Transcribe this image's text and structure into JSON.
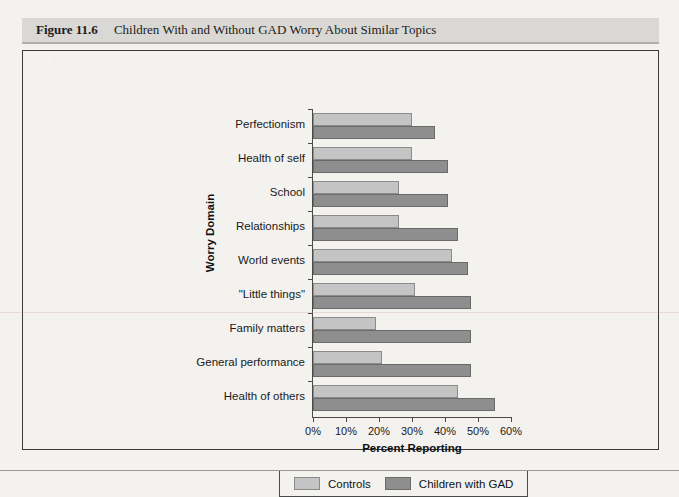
{
  "figure": {
    "label": "Figure 11.6",
    "title": "Children With and Without GAD Worry About Similar Topics"
  },
  "chart_data": {
    "type": "bar",
    "orientation": "horizontal",
    "title": "Children With and Without GAD Worry About Similar Topics",
    "xlabel": "Percent Reporting",
    "ylabel": "Worry Domain",
    "xlim": [
      0,
      60
    ],
    "xticks": [
      0,
      10,
      20,
      30,
      40,
      50,
      60
    ],
    "xtick_labels": [
      "0%",
      "10%",
      "20%",
      "30%",
      "40%",
      "50%",
      "60%"
    ],
    "grid": false,
    "legend_position": "bottom",
    "categories": [
      "Perfectionism",
      "Health of self",
      "School",
      "Relationships",
      "World events",
      "\"Little things\"",
      "Family matters",
      "General performance",
      "Health of others"
    ],
    "series": [
      {
        "name": "Controls",
        "color": "#c4c4c4",
        "values": [
          30,
          30,
          26,
          26,
          42,
          31,
          19,
          21,
          44
        ]
      },
      {
        "name": "Children with GAD",
        "color": "#8e8e8e",
        "values": [
          37,
          41,
          41,
          44,
          47,
          48,
          48,
          48,
          55
        ]
      }
    ]
  },
  "legend": {
    "items": [
      {
        "label": "Controls",
        "swatch": "controls"
      },
      {
        "label": "Children with GAD",
        "swatch": "gad"
      }
    ]
  }
}
